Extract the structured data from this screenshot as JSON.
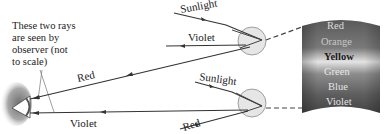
{
  "annotation": {
    "lines": [
      "These two rays",
      "are seen by",
      "observer (not",
      "to scale)"
    ]
  },
  "top_drop": {
    "incoming_label": "Sunlight",
    "outgoing_label": "Violet",
    "observed_label": "Red"
  },
  "bottom_drop": {
    "incoming_label": "Sunlight",
    "outgoing_label": "Red",
    "observed_label": "Violet"
  },
  "rainbow": {
    "colors": [
      "Red",
      "Orange",
      "Yellow",
      "Green",
      "Blue",
      "Violet"
    ]
  },
  "colors": {
    "ray": "#333333",
    "drop_fill": "#e6e6e6",
    "drop_stroke": "#8a8a8a",
    "band_dark": "#4a4a4a",
    "band_light": "#d8d8d8"
  }
}
